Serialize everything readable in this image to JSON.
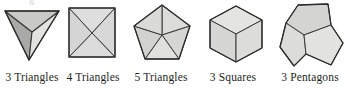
{
  "page": {
    "background_color": "#ffffff",
    "scan_artifact_text": "g",
    "stroke_color": "#3a3a38",
    "label_color": "#231f20"
  },
  "figures": [
    {
      "id": "tetra",
      "name": "three-triangles-figure",
      "label": "3 Triangles",
      "shape": "tetrahedron-vertex-view",
      "count": 3,
      "polygon": "Triangles",
      "faces": [
        {
          "name": "left-face",
          "fill": "#a9a9a7"
        },
        {
          "name": "right-face",
          "fill": "#e2e2e0"
        },
        {
          "name": "top-face",
          "fill": "#c9c9c6"
        }
      ]
    },
    {
      "id": "square",
      "name": "four-triangles-figure",
      "label": "4 Triangles",
      "shape": "square-with-diagonals",
      "count": 4,
      "polygon": "Triangles",
      "faces": [
        {
          "name": "top-face",
          "fill": "#dedede"
        },
        {
          "name": "right-face",
          "fill": "#d8d8d8"
        },
        {
          "name": "bottom-face",
          "fill": "#dcdcdc"
        },
        {
          "name": "left-face",
          "fill": "#d5d5d5"
        }
      ]
    },
    {
      "id": "pent5",
      "name": "five-triangles-figure",
      "label": "5 Triangles",
      "shape": "pentagon-with-five-triangles",
      "count": 5,
      "polygon": "Triangles",
      "faces": [
        {
          "name": "face-1",
          "fill": "#dcdcda"
        },
        {
          "name": "face-2",
          "fill": "#d6d6d4"
        },
        {
          "name": "face-3",
          "fill": "#e0e0de"
        },
        {
          "name": "face-4",
          "fill": "#d2d2d0"
        },
        {
          "name": "face-5",
          "fill": "#dadad8"
        }
      ]
    },
    {
      "id": "cube",
      "name": "three-squares-figure",
      "label": "3 Squares",
      "shape": "cube-corner-view",
      "count": 3,
      "polygon": "Squares",
      "faces": [
        {
          "name": "top-face",
          "fill": "#e4e4e2"
        },
        {
          "name": "left-face",
          "fill": "#d6d6d4"
        },
        {
          "name": "right-face",
          "fill": "#dcdcda"
        }
      ]
    },
    {
      "id": "dodeca",
      "name": "three-pentagons-figure",
      "label": "3 Pentagons",
      "shape": "dodecahedron-corner-view",
      "count": 3,
      "polygon": "Pentagons",
      "faces": [
        {
          "name": "upper-face",
          "fill": "#d4d4d2"
        },
        {
          "name": "left-face",
          "fill": "#dcdcda"
        },
        {
          "name": "right-face",
          "fill": "#e2e2e0"
        }
      ]
    }
  ]
}
